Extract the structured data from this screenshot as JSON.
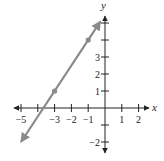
{
  "chart_data": {
    "type": "line",
    "title": "",
    "xlabel": "x",
    "ylabel": "y",
    "xlim": [
      -5.3,
      2.6
    ],
    "ylim": [
      -2.5,
      5.4
    ],
    "x_ticks": [
      -5,
      -4,
      -3,
      -2,
      -1,
      1,
      2
    ],
    "x_tick_labels": [
      "−5",
      "",
      "−3",
      "−2",
      "−1",
      "1",
      "2"
    ],
    "y_ticks": [
      -2,
      -1,
      1,
      2,
      3,
      4,
      5
    ],
    "y_tick_labels": [
      "−2",
      "",
      "1",
      "2",
      "3",
      "",
      ""
    ],
    "grid": false,
    "series": [
      {
        "name": "line",
        "equation": "y = 1.5x + 5.5",
        "color": "#8a8a8a",
        "x": [
          -5,
          -0.27
        ],
        "y": [
          -2,
          5.1
        ],
        "arrows": "both",
        "points": [
          {
            "x": -3,
            "y": 1
          },
          {
            "x": -1,
            "y": 4
          }
        ]
      }
    ]
  },
  "layout": {
    "origin_px": [
      105,
      108
    ],
    "unit_px_x": 16.8,
    "unit_px_y": 17.0,
    "axis_color": "#222222"
  }
}
